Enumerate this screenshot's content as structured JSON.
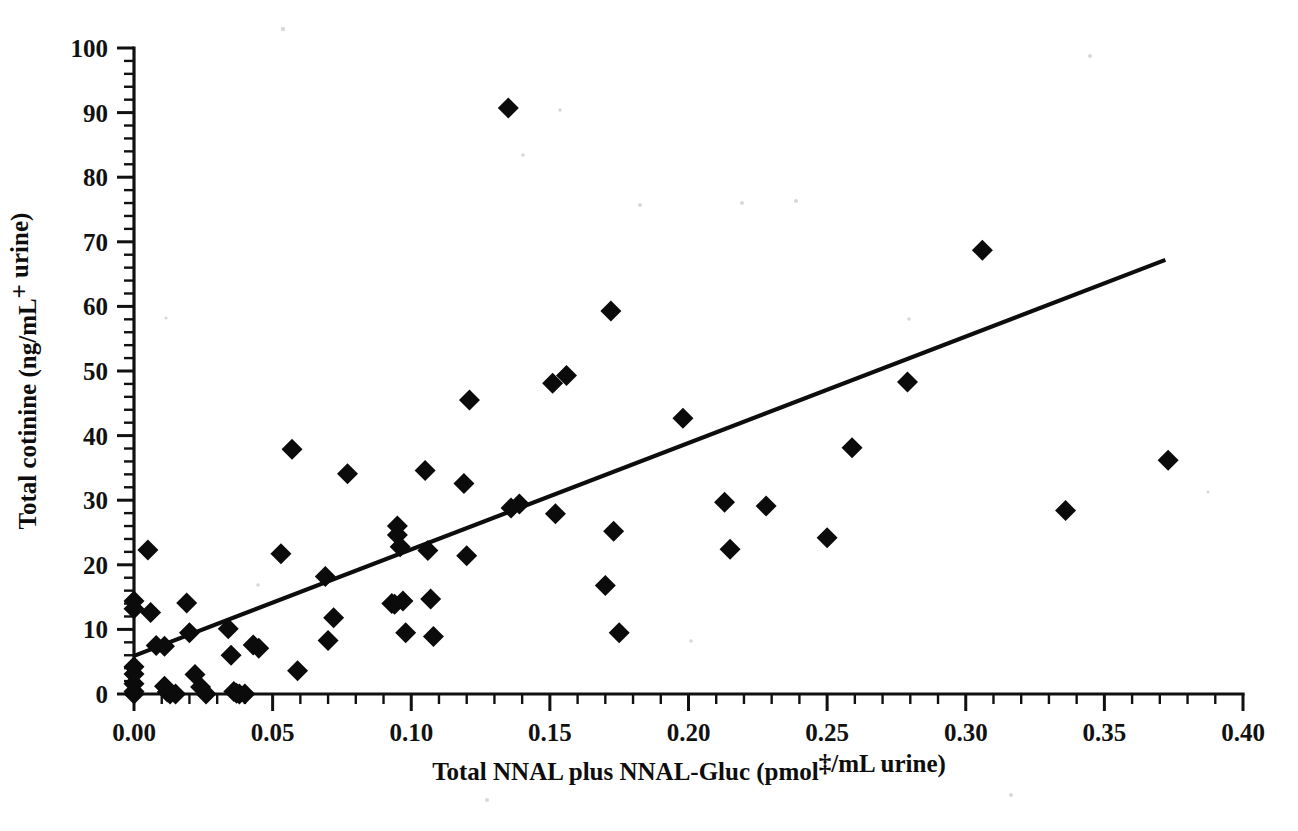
{
  "figure": {
    "kind": "scatter-plot-figure",
    "background_color": "#ffffff",
    "ink_color": "#0b0b0b"
  },
  "chart_data": {
    "type": "scatter",
    "title": "",
    "subtitle": "",
    "xlabel": "Total NNAL plus NNAL-Gluc (pmol‡/mL urine)",
    "ylabel": "Total cotinine (ng/mL⁺ urine)",
    "xlim": [
      0.0,
      0.4
    ],
    "ylim": [
      0,
      100
    ],
    "xticklabels": [
      "0.00",
      "0.05",
      "0.10",
      "0.15",
      "0.20",
      "0.25",
      "0.30",
      "0.35",
      "0.40"
    ],
    "xtickvalues": [
      0.0,
      0.05,
      0.1,
      0.15,
      0.2,
      0.25,
      0.3,
      0.35,
      0.4
    ],
    "x_minor_ticks_per_interval": 5,
    "yticklabels": [
      "0",
      "10",
      "20",
      "30",
      "40",
      "50",
      "60",
      "70",
      "80",
      "90",
      "100"
    ],
    "ytickvalues": [
      0,
      10,
      20,
      30,
      40,
      50,
      60,
      70,
      80,
      90,
      100
    ],
    "y_minor_ticks_per_interval": 5,
    "grid": false,
    "legend": null,
    "marker_style": "filled-diamond",
    "points": [
      {
        "x": 0.0,
        "y": 14.4
      },
      {
        "x": 0.0,
        "y": 13.2
      },
      {
        "x": 0.0,
        "y": 4.2
      },
      {
        "x": 0.0,
        "y": 3.1
      },
      {
        "x": 0.0,
        "y": 1.6
      },
      {
        "x": 0.0,
        "y": 0.4
      },
      {
        "x": 0.0,
        "y": 0.0
      },
      {
        "x": 0.005,
        "y": 22.3
      },
      {
        "x": 0.006,
        "y": 12.6
      },
      {
        "x": 0.008,
        "y": 7.5
      },
      {
        "x": 0.011,
        "y": 7.4
      },
      {
        "x": 0.011,
        "y": 1.2
      },
      {
        "x": 0.012,
        "y": 0.3
      },
      {
        "x": 0.013,
        "y": 0.0
      },
      {
        "x": 0.015,
        "y": 0.0
      },
      {
        "x": 0.019,
        "y": 14.1
      },
      {
        "x": 0.02,
        "y": 9.5
      },
      {
        "x": 0.022,
        "y": 3.0
      },
      {
        "x": 0.024,
        "y": 1.1
      },
      {
        "x": 0.026,
        "y": 0.0
      },
      {
        "x": 0.034,
        "y": 10.1
      },
      {
        "x": 0.035,
        "y": 6.0
      },
      {
        "x": 0.036,
        "y": 0.4
      },
      {
        "x": 0.037,
        "y": 0.1
      },
      {
        "x": 0.038,
        "y": 0.0
      },
      {
        "x": 0.04,
        "y": 0.0
      },
      {
        "x": 0.043,
        "y": 7.6
      },
      {
        "x": 0.045,
        "y": 7.1
      },
      {
        "x": 0.053,
        "y": 21.7
      },
      {
        "x": 0.057,
        "y": 37.9
      },
      {
        "x": 0.059,
        "y": 3.6
      },
      {
        "x": 0.069,
        "y": 18.2
      },
      {
        "x": 0.07,
        "y": 8.3
      },
      {
        "x": 0.072,
        "y": 11.8
      },
      {
        "x": 0.077,
        "y": 34.1
      },
      {
        "x": 0.093,
        "y": 14.0
      },
      {
        "x": 0.094,
        "y": 13.9
      },
      {
        "x": 0.095,
        "y": 26.0
      },
      {
        "x": 0.095,
        "y": 24.6
      },
      {
        "x": 0.096,
        "y": 22.8
      },
      {
        "x": 0.097,
        "y": 14.4
      },
      {
        "x": 0.098,
        "y": 9.5
      },
      {
        "x": 0.105,
        "y": 34.6
      },
      {
        "x": 0.106,
        "y": 22.2
      },
      {
        "x": 0.107,
        "y": 14.7
      },
      {
        "x": 0.108,
        "y": 8.9
      },
      {
        "x": 0.119,
        "y": 32.6
      },
      {
        "x": 0.12,
        "y": 21.4
      },
      {
        "x": 0.121,
        "y": 45.5
      },
      {
        "x": 0.135,
        "y": 90.7
      },
      {
        "x": 0.136,
        "y": 28.8
      },
      {
        "x": 0.139,
        "y": 29.4
      },
      {
        "x": 0.151,
        "y": 48.1
      },
      {
        "x": 0.152,
        "y": 27.9
      },
      {
        "x": 0.156,
        "y": 49.3
      },
      {
        "x": 0.17,
        "y": 16.8
      },
      {
        "x": 0.172,
        "y": 59.3
      },
      {
        "x": 0.173,
        "y": 25.2
      },
      {
        "x": 0.175,
        "y": 9.5
      },
      {
        "x": 0.198,
        "y": 42.7
      },
      {
        "x": 0.213,
        "y": 29.7
      },
      {
        "x": 0.215,
        "y": 22.4
      },
      {
        "x": 0.228,
        "y": 29.1
      },
      {
        "x": 0.25,
        "y": 24.2
      },
      {
        "x": 0.259,
        "y": 38.1
      },
      {
        "x": 0.279,
        "y": 48.3
      },
      {
        "x": 0.306,
        "y": 68.7
      },
      {
        "x": 0.336,
        "y": 28.4
      },
      {
        "x": 0.373,
        "y": 36.2
      }
    ],
    "trendline": {
      "kind": "linear-fit",
      "x_start": 0.0,
      "y_start": 5.9,
      "x_end": 0.372,
      "y_end": 67.2
    }
  }
}
